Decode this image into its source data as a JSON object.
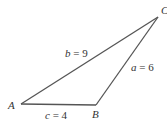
{
  "figure": {
    "type": "triangle",
    "vertices": {
      "A": {
        "label": "A",
        "x": 21,
        "y": 104
      },
      "B": {
        "label": "B",
        "x": 96,
        "y": 105
      },
      "C": {
        "label": "C",
        "x": 158,
        "y": 17
      }
    },
    "sides": {
      "a": {
        "text": "a = 6",
        "var": "a",
        "value": "6"
      },
      "b": {
        "text": "b = 9",
        "var": "b",
        "value": "9"
      },
      "c": {
        "text": "c = 4",
        "var": "c",
        "value": "4"
      }
    },
    "colors": {
      "line": "#555555",
      "text": "#333333",
      "background": "#ffffff"
    }
  }
}
